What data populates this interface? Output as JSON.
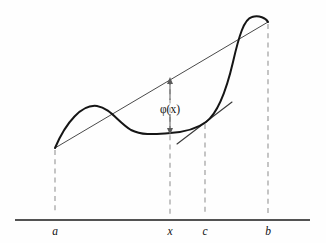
{
  "figure": {
    "background_color": "#fefefe",
    "width": 326,
    "height": 243
  },
  "annotations": {
    "gap_label": "φ(x)",
    "gap_label_x": 170,
    "gap_label_y": 110
  },
  "axis": {
    "label": "x-axis",
    "color": "#1a1a1a",
    "y": 220,
    "x_start": 15,
    "x_end": 310
  },
  "tick_labels": [
    {
      "text": "a",
      "x": 55,
      "label_x": 55,
      "label_y": 235
    },
    {
      "text": "x",
      "x": 170,
      "label_x": 170,
      "label_y": 235
    },
    {
      "text": "c",
      "x": 205,
      "label_x": 205,
      "label_y": 235
    },
    {
      "text": "b",
      "x": 268,
      "label_x": 268,
      "label_y": 235
    }
  ],
  "chart_data": {
    "type": "line",
    "xlabel": "",
    "ylabel": "",
    "grid": false,
    "legend": "none",
    "axis_only": "horizontal",
    "x_tick_values": [
      "a",
      "x",
      "c",
      "b"
    ],
    "x_tick_pixels": [
      55,
      170,
      205,
      268
    ],
    "series": [
      {
        "name": "curve",
        "role": "function f(x)",
        "color": "#151515",
        "path": "M 55 148 C 66 122, 82 104, 97 106 C 110 108, 118 122, 131 130 C 143 136, 156 134, 170 133 C 186 132, 198 128, 206 122 C 218 113, 226 92, 233 62 C 239 36, 244 19, 252 17 C 259 15, 266 18, 268 22",
        "points": [
          {
            "label": "a",
            "x": 55,
            "y": 148
          },
          {
            "label": "local-max",
            "x": 100,
            "y": 105
          },
          {
            "label": "local-min",
            "x": 170,
            "y": 133
          },
          {
            "label": "c",
            "x": 206,
            "y": 122
          },
          {
            "label": "peak",
            "x": 252,
            "y": 17
          },
          {
            "label": "b",
            "x": 268,
            "y": 22
          }
        ]
      },
      {
        "name": "chord",
        "role": "secant line through (a, f(a)) and (b, f(b))",
        "color": "#4a4a4a",
        "x1": 55,
        "y1": 148,
        "x2": 268,
        "y2": 22
      },
      {
        "name": "tangent",
        "role": "tangent line to curve at c",
        "color": "#3a3a3a",
        "x1": 177,
        "y1": 144,
        "x2": 232,
        "y2": 102
      }
    ],
    "gap_marker": {
      "name": "phi-gap",
      "label": "φ(x)",
      "x": 170,
      "y_top": 80,
      "y_bottom": 132,
      "meaning": "vertical distance from chord down to curve at abscissa x"
    },
    "drop_lines": [
      {
        "label": "a",
        "x": 55,
        "y_top": 150,
        "y_bottom": 214
      },
      {
        "label": "x",
        "x": 170,
        "y_top": 80,
        "y_bottom": 214
      },
      {
        "label": "c",
        "x": 205,
        "y_top": 124,
        "y_bottom": 214
      },
      {
        "label": "b",
        "x": 268,
        "y_top": 24,
        "y_bottom": 214
      }
    ]
  }
}
